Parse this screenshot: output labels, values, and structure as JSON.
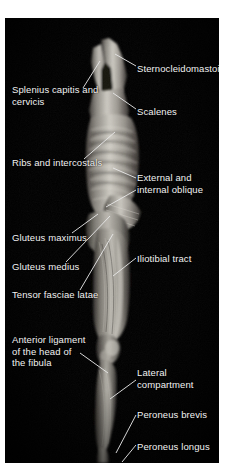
{
  "figure": {
    "kind": "anatomical-photograph",
    "view": "lateral whole-body dissection",
    "background_color": "#000000",
    "page_color": "#ffffff",
    "label_color": "#f2f2f2",
    "leader_color": "#e8e8e8",
    "plate": {
      "x": 5,
      "y": 18,
      "width": 214,
      "height": 445
    }
  },
  "labels": [
    {
      "id": "sternocleidomastoid",
      "text": "Sternocleidomastoid",
      "side": "right",
      "x": 137,
      "y": 63,
      "leader": {
        "x1": 136,
        "y1": 66,
        "x2": 114,
        "y2": 53
      }
    },
    {
      "id": "splenius-capitis-and-cervicis",
      "text": "Splenius capitis and\ncervicis",
      "side": "left",
      "x": 12,
      "y": 84,
      "leader": {
        "x1": 83,
        "y1": 85,
        "x2": 99,
        "y2": 58
      }
    },
    {
      "id": "scalenes",
      "text": "Scalenes",
      "side": "right",
      "x": 137,
      "y": 106,
      "leader": {
        "x1": 136,
        "y1": 109,
        "x2": 113,
        "y2": 92
      }
    },
    {
      "id": "ribs-and-intercostals",
      "text": "Ribs and intercostals",
      "side": "left",
      "x": 12,
      "y": 157,
      "leader": {
        "x1": 84,
        "y1": 157,
        "x2": 115,
        "y2": 130
      }
    },
    {
      "id": "external-and-internal-oblique",
      "text": "External and\ninternal oblique",
      "side": "right",
      "x": 137,
      "y": 172,
      "leader": {
        "x1": 136,
        "y1": 177,
        "x2": 113,
        "y2": 167
      }
    },
    {
      "id": "external-and-internal-oblique-lower",
      "text": "",
      "side": "right",
      "x": 137,
      "y": 188,
      "leader": {
        "x1": 136,
        "y1": 189,
        "x2": 106,
        "y2": 205
      }
    },
    {
      "id": "gluteus-maximus",
      "text": "Gluteus maximus",
      "side": "left",
      "x": 12,
      "y": 232,
      "leader": {
        "x1": 72,
        "y1": 232,
        "x2": 98,
        "y2": 213
      }
    },
    {
      "id": "gluteus-medius",
      "text": "Gluteus medius",
      "side": "left",
      "x": 12,
      "y": 261,
      "leader": {
        "x1": 66,
        "y1": 261,
        "x2": 110,
        "y2": 215
      }
    },
    {
      "id": "tensor-fasciae-latae",
      "text": "Tensor fasciae latae",
      "side": "left",
      "x": 12,
      "y": 290,
      "leader": {
        "x1": 80,
        "y1": 289,
        "x2": 113,
        "y2": 233
      }
    },
    {
      "id": "iliotibial-tract",
      "text": "Iliotibial tract",
      "side": "right",
      "x": 137,
      "y": 253,
      "leader": {
        "x1": 136,
        "y1": 257,
        "x2": 113,
        "y2": 275
      }
    },
    {
      "id": "anterior-ligament-of-the-head-of-the-fibula",
      "text": "Anterior ligament\nof the head of\nthe fibula",
      "side": "left",
      "x": 12,
      "y": 334,
      "leader": {
        "x1": 80,
        "y1": 352,
        "x2": 108,
        "y2": 372
      }
    },
    {
      "id": "lateral-compartment",
      "text": "Lateral\ncompartment",
      "side": "right",
      "x": 137,
      "y": 367,
      "leader": {
        "x1": 136,
        "y1": 379,
        "x2": 110,
        "y2": 398
      }
    },
    {
      "id": "peroneus-brevis",
      "text": "Peroneus brevis",
      "side": "right",
      "x": 137,
      "y": 409,
      "leader": {
        "x1": 136,
        "y1": 414,
        "x2": 116,
        "y2": 452
      }
    },
    {
      "id": "peroneus-longus",
      "text": "Peroneus longus",
      "side": "right",
      "x": 137,
      "y": 441,
      "leader": {
        "x1": 136,
        "y1": 444,
        "x2": 122,
        "y2": 461
      }
    }
  ]
}
